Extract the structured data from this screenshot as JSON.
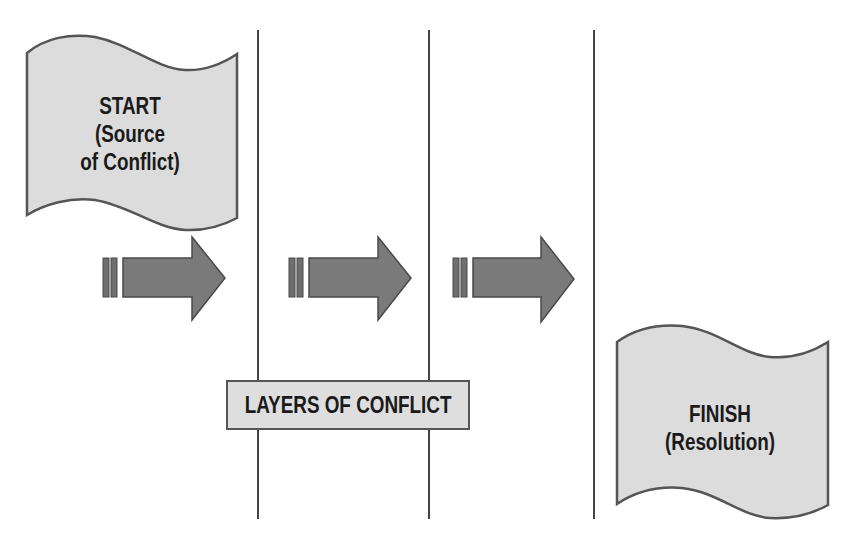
{
  "diagram": {
    "start": {
      "title": "START",
      "line2": "(Source",
      "line3": "of Conflict)"
    },
    "finish": {
      "title": "FINISH",
      "line2": "(Resolution)"
    },
    "layers_label": "LAYERS OF CONFLICT",
    "arrows": [
      {
        "id": "arrow-1",
        "direction": "right"
      },
      {
        "id": "arrow-2",
        "direction": "right"
      },
      {
        "id": "arrow-3",
        "direction": "right"
      }
    ],
    "divider_count": 3,
    "colors": {
      "flag_fill": "#dcdcdc",
      "flag_stroke": "#555555",
      "arrow_fill": "#7a7a7a",
      "arrow_stroke": "#4a4a4a",
      "divider": "#444444",
      "text": "#1a1a1a"
    }
  }
}
